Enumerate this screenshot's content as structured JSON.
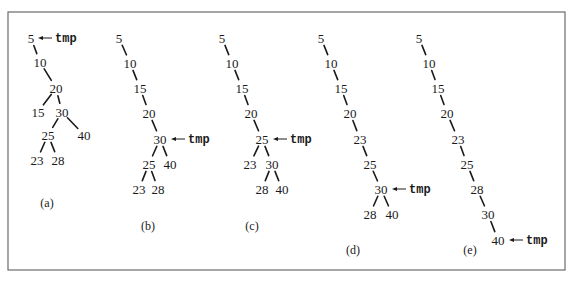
{
  "figure": {
    "pointer_name": "tmp",
    "trees": [
      {
        "label": "(a)",
        "nodes": [
          {
            "id": "5",
            "text": "5"
          },
          {
            "id": "10",
            "text": "10"
          },
          {
            "id": "20",
            "text": "20"
          },
          {
            "id": "15",
            "text": "15"
          },
          {
            "id": "30",
            "text": "30"
          },
          {
            "id": "25",
            "text": "25"
          },
          {
            "id": "40",
            "text": "40"
          },
          {
            "id": "23",
            "text": "23"
          },
          {
            "id": "28",
            "text": "28"
          }
        ],
        "edges": [
          [
            "5",
            "10"
          ],
          [
            "10",
            "20"
          ],
          [
            "20",
            "15"
          ],
          [
            "20",
            "30"
          ],
          [
            "30",
            "25"
          ],
          [
            "30",
            "40"
          ],
          [
            "25",
            "23"
          ],
          [
            "25",
            "28"
          ]
        ],
        "tmp_at": "5"
      },
      {
        "label": "(b)",
        "nodes": [
          {
            "id": "5",
            "text": "5"
          },
          {
            "id": "10",
            "text": "10"
          },
          {
            "id": "15",
            "text": "15"
          },
          {
            "id": "20",
            "text": "20"
          },
          {
            "id": "30",
            "text": "30"
          },
          {
            "id": "25",
            "text": "25"
          },
          {
            "id": "40",
            "text": "40"
          },
          {
            "id": "23",
            "text": "23"
          },
          {
            "id": "28",
            "text": "28"
          }
        ],
        "edges": [
          [
            "5",
            "10"
          ],
          [
            "10",
            "15"
          ],
          [
            "15",
            "20"
          ],
          [
            "20",
            "30"
          ],
          [
            "30",
            "25"
          ],
          [
            "30",
            "40"
          ],
          [
            "25",
            "23"
          ],
          [
            "25",
            "28"
          ]
        ],
        "tmp_at": "30"
      },
      {
        "label": "(c)",
        "nodes": [
          {
            "id": "5",
            "text": "5"
          },
          {
            "id": "10",
            "text": "10"
          },
          {
            "id": "15",
            "text": "15"
          },
          {
            "id": "20",
            "text": "20"
          },
          {
            "id": "25",
            "text": "25"
          },
          {
            "id": "23",
            "text": "23"
          },
          {
            "id": "30",
            "text": "30"
          },
          {
            "id": "28",
            "text": "28"
          },
          {
            "id": "40",
            "text": "40"
          }
        ],
        "edges": [
          [
            "5",
            "10"
          ],
          [
            "10",
            "15"
          ],
          [
            "15",
            "20"
          ],
          [
            "20",
            "25"
          ],
          [
            "25",
            "23"
          ],
          [
            "25",
            "30"
          ],
          [
            "30",
            "28"
          ],
          [
            "30",
            "40"
          ]
        ],
        "tmp_at": "25"
      },
      {
        "label": "(d)",
        "nodes": [
          {
            "id": "5",
            "text": "5"
          },
          {
            "id": "10",
            "text": "10"
          },
          {
            "id": "15",
            "text": "15"
          },
          {
            "id": "20",
            "text": "20"
          },
          {
            "id": "23",
            "text": "23"
          },
          {
            "id": "25",
            "text": "25"
          },
          {
            "id": "30",
            "text": "30"
          },
          {
            "id": "28",
            "text": "28"
          },
          {
            "id": "40",
            "text": "40"
          }
        ],
        "edges": [
          [
            "5",
            "10"
          ],
          [
            "10",
            "15"
          ],
          [
            "15",
            "20"
          ],
          [
            "20",
            "23"
          ],
          [
            "23",
            "25"
          ],
          [
            "25",
            "30"
          ],
          [
            "30",
            "28"
          ],
          [
            "30",
            "40"
          ]
        ],
        "tmp_at": "30"
      },
      {
        "label": "(e)",
        "nodes": [
          {
            "id": "5",
            "text": "5"
          },
          {
            "id": "10",
            "text": "10"
          },
          {
            "id": "15",
            "text": "15"
          },
          {
            "id": "20",
            "text": "20"
          },
          {
            "id": "23",
            "text": "23"
          },
          {
            "id": "25",
            "text": "25"
          },
          {
            "id": "28",
            "text": "28"
          },
          {
            "id": "30",
            "text": "30"
          },
          {
            "id": "40",
            "text": "40"
          }
        ],
        "edges": [
          [
            "5",
            "10"
          ],
          [
            "10",
            "15"
          ],
          [
            "15",
            "20"
          ],
          [
            "20",
            "23"
          ],
          [
            "23",
            "25"
          ],
          [
            "25",
            "28"
          ],
          [
            "28",
            "30"
          ],
          [
            "30",
            "40"
          ]
        ],
        "tmp_at": "40"
      }
    ]
  }
}
